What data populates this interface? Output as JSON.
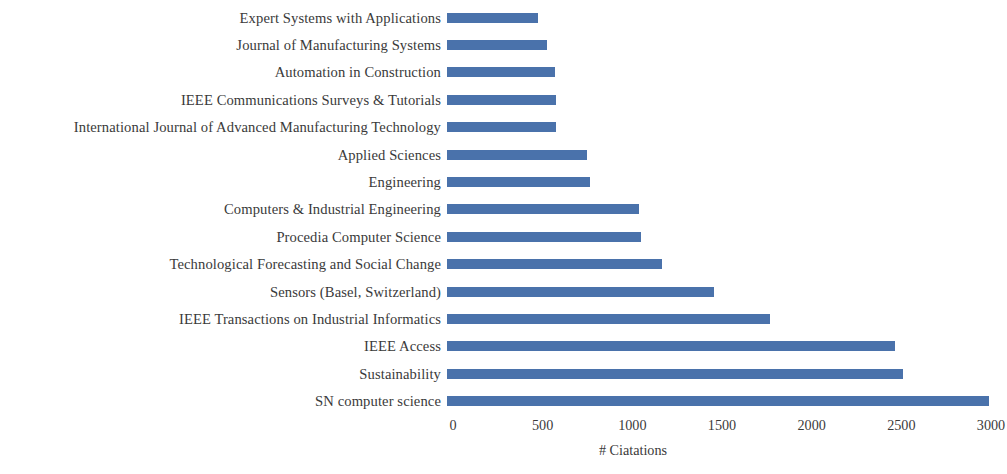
{
  "chart_data": {
    "type": "bar",
    "orientation": "horizontal",
    "title": "",
    "xlabel": "# Ciatations",
    "ylabel": "",
    "xlim": [
      0,
      3000
    ],
    "xticks": [
      0,
      500,
      1000,
      1500,
      2000,
      2500,
      3000
    ],
    "xtick_labels": [
      "0",
      "500",
      "1000",
      "1500",
      "2000",
      "2500",
      "3000"
    ],
    "grid": false,
    "legend": false,
    "bar_color": "#4a72ab",
    "categories": [
      "Expert Systems with Applications",
      "Journal of Manufacturing Systems",
      "Automation in Construction",
      "IEEE Communications Surveys & Tutorials",
      "International Journal of Advanced Manufacturing Technology",
      "Applied Sciences",
      "Engineering",
      "Computers & Industrial Engineering",
      "Procedia Computer Science",
      "Technological Forecasting and Social Change",
      "Sensors (Basel, Switzerland)",
      "IEEE Transactions on Industrial Informatics",
      "IEEE Access",
      "Sustainability",
      "SN computer science"
    ],
    "values": [
      510,
      560,
      600,
      610,
      610,
      780,
      800,
      1070,
      1080,
      1200,
      1490,
      1800,
      2500,
      2540,
      3020
    ]
  }
}
